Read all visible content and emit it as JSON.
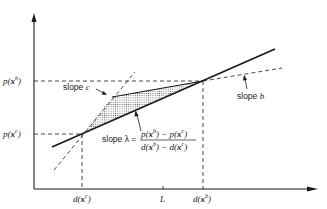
{
  "diagram": {
    "axes": {
      "y_labels": {
        "p_b": {
          "base": "p(",
          "var": "x",
          "sup": "b",
          "close": ")"
        },
        "p_c": {
          "base": "p(",
          "var": "x",
          "sup": "c",
          "close": ")"
        }
      },
      "x_labels": {
        "d_c": {
          "base": "d(",
          "var": "x",
          "sup": "c",
          "close": ")"
        },
        "L": "L",
        "d_b": {
          "base": "d(",
          "var": "x",
          "sup": "b",
          "close": ")"
        }
      }
    },
    "annotations": {
      "slope_c": {
        "text": "slope ",
        "var": "c"
      },
      "slope_b": {
        "text": "slope ",
        "var": "b"
      },
      "slope_lambda": {
        "prefix": "slope λ =",
        "numerator": "p(x^b) − p(x^c)",
        "denominator": "d(x^b) − d(x^c)"
      }
    },
    "colors": {
      "line": "#1a1a1a",
      "shade": "#9a9a9a",
      "background": "#ffffff"
    }
  }
}
